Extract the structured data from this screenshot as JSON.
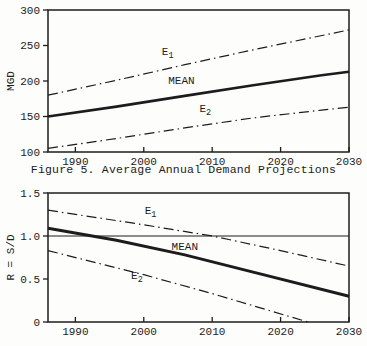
{
  "figure": {
    "caption": "Figure 5. Average Annual Demand Projections"
  },
  "colors": {
    "ink": "#1c1c1c",
    "background": "#fdfdfb"
  },
  "chart_data": [
    {
      "id": "demand",
      "type": "line",
      "title": "",
      "xlabel": "",
      "ylabel": "MGD",
      "xlim": [
        1986,
        2030
      ],
      "ylim": [
        100,
        300
      ],
      "grid": false,
      "legend_position": "inline-labels",
      "xticks": [
        {
          "v": 1990,
          "t": "1990"
        },
        {
          "v": 2000,
          "t": "2000"
        },
        {
          "v": 2010,
          "t": "2010"
        },
        {
          "v": 2020,
          "t": "2020"
        },
        {
          "v": 2030,
          "t": "2030"
        }
      ],
      "yticks": [
        {
          "v": 100,
          "t": "100"
        },
        {
          "v": 150,
          "t": "150"
        },
        {
          "v": 200,
          "t": "200"
        },
        {
          "v": 250,
          "t": "250"
        },
        {
          "v": 300,
          "t": "300"
        }
      ],
      "series": [
        {
          "name": "E1",
          "label_main": "E",
          "label_sub": "1",
          "style": "dashdot",
          "stroke_width": 1.2,
          "points": [
            [
              1986,
              180
            ],
            [
              1996,
              201
            ],
            [
              2006,
              223
            ],
            [
              2016,
              244
            ],
            [
              2030,
              272
            ]
          ],
          "label_x": 2003.5,
          "label_y": 237
        },
        {
          "name": "MEAN",
          "label_main": "MEAN",
          "label_sub": "",
          "style": "solid",
          "stroke_width": 2.6,
          "points": [
            [
              1986,
              150
            ],
            [
              1996,
              164
            ],
            [
              2006,
              179
            ],
            [
              2016,
              194
            ],
            [
              2026,
              208
            ],
            [
              2030,
              213
            ]
          ],
          "label_x": 2005.5,
          "label_y": 196
        },
        {
          "name": "E2",
          "label_main": "E",
          "label_sub": "2",
          "style": "dashdot",
          "stroke_width": 1.2,
          "points": [
            [
              1986,
              105
            ],
            [
              1996,
              119
            ],
            [
              2006,
              134
            ],
            [
              2016,
              148
            ],
            [
              2026,
              159
            ],
            [
              2030,
              163
            ]
          ],
          "label_x": 2009,
          "label_y": 156
        }
      ]
    },
    {
      "id": "ratio",
      "type": "line",
      "title": "",
      "xlabel": "",
      "ylabel": "R = S/D",
      "xlim": [
        1986,
        2030
      ],
      "ylim": [
        0,
        1.5
      ],
      "grid": false,
      "legend_position": "inline-labels",
      "xticks": [
        {
          "v": 1990,
          "t": "1990"
        },
        {
          "v": 2000,
          "t": "2000"
        },
        {
          "v": 2010,
          "t": "2010"
        },
        {
          "v": 2020,
          "t": "2020"
        },
        {
          "v": 2030,
          "t": "2030"
        }
      ],
      "yticks": [
        {
          "v": 0,
          "t": "0"
        },
        {
          "v": 0.5,
          "t": "0.5"
        },
        {
          "v": 1.0,
          "t": "1.0"
        },
        {
          "v": 1.5,
          "t": "1.5"
        }
      ],
      "series": [
        {
          "name": "reference-1",
          "label_main": "",
          "label_sub": "",
          "style": "solid",
          "stroke_width": 1,
          "points": [
            [
              1986,
              1.0
            ],
            [
              2030,
              1.0
            ]
          ],
          "label_x": null,
          "label_y": null
        },
        {
          "name": "E1",
          "label_main": "E",
          "label_sub": "1",
          "style": "dashdot",
          "stroke_width": 1.2,
          "points": [
            [
              1986,
              1.3
            ],
            [
              2000,
              1.13
            ],
            [
              2010,
              1.0
            ],
            [
              2020,
              0.83
            ],
            [
              2030,
              0.65
            ]
          ],
          "label_x": 2001,
          "label_y": 1.26
        },
        {
          "name": "MEAN",
          "label_main": "MEAN",
          "label_sub": "",
          "style": "solid",
          "stroke_width": 3,
          "points": [
            [
              1986,
              1.09
            ],
            [
              1996,
              0.95
            ],
            [
              2006,
              0.78
            ],
            [
              2016,
              0.58
            ],
            [
              2030,
              0.3
            ]
          ],
          "label_x": 2006,
          "label_y": 0.84
        },
        {
          "name": "E2",
          "label_main": "E",
          "label_sub": "2",
          "style": "dashdot",
          "stroke_width": 1.2,
          "points": [
            [
              1986,
              0.83
            ],
            [
              2000,
              0.55
            ],
            [
              2010,
              0.33
            ],
            [
              2024,
              0.0
            ]
          ],
          "label_x": 1999,
          "label_y": 0.5
        }
      ]
    }
  ]
}
